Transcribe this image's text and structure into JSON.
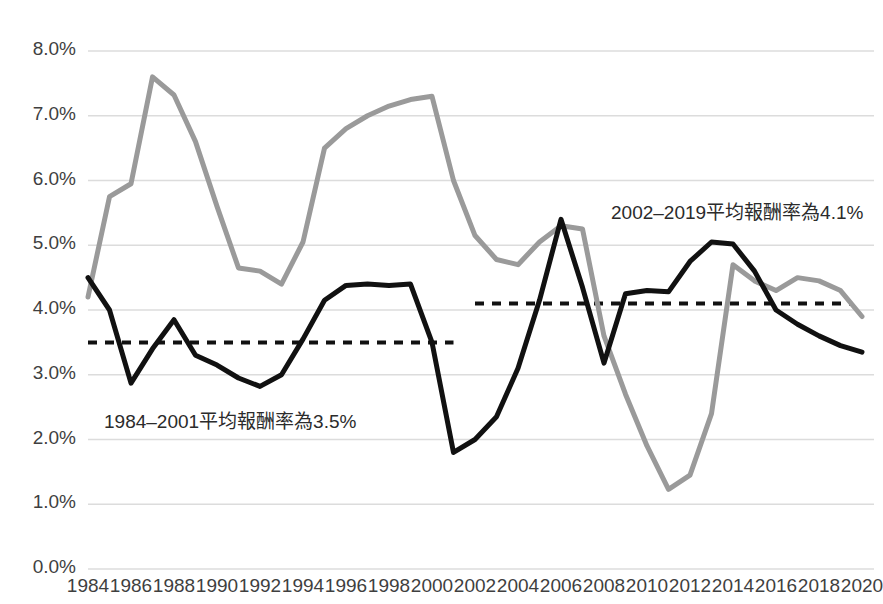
{
  "chart_data": {
    "type": "line",
    "title": "",
    "subtitle": "",
    "xlabel": "",
    "ylabel": "",
    "xlim": [
      1984,
      2020
    ],
    "ylim": [
      0.0,
      8.0
    ],
    "y_unit": "%",
    "grid": true,
    "legend_position": "none",
    "x": [
      1984,
      1985,
      1986,
      1987,
      1988,
      1989,
      1990,
      1991,
      1992,
      1993,
      1994,
      1995,
      1996,
      1997,
      1998,
      1999,
      2000,
      2001,
      2002,
      2003,
      2004,
      2005,
      2006,
      2007,
      2008,
      2009,
      2010,
      2011,
      2012,
      2013,
      2014,
      2015,
      2016,
      2017,
      2018,
      2019,
      2020
    ],
    "y_ticks": [
      "0.0%",
      "1.0%",
      "2.0%",
      "3.0%",
      "4.0%",
      "5.0%",
      "6.0%",
      "7.0%",
      "8.0%"
    ],
    "y_tick_values": [
      0.0,
      1.0,
      2.0,
      3.0,
      4.0,
      5.0,
      6.0,
      7.0,
      8.0
    ],
    "x_ticks": [
      "1984",
      "1986",
      "1988",
      "1990",
      "1992",
      "1994",
      "1996",
      "1998",
      "2000",
      "2002",
      "2004",
      "2006",
      "2008",
      "2010",
      "2012",
      "2014",
      "2016",
      "2018",
      "2020"
    ],
    "x_tick_values": [
      1984,
      1986,
      1988,
      1990,
      1992,
      1994,
      1996,
      1998,
      2000,
      2002,
      2004,
      2006,
      2008,
      2010,
      2012,
      2014,
      2016,
      2018,
      2020
    ],
    "series": [
      {
        "name": "black-series",
        "color": "#111111",
        "width": 5,
        "values": [
          4.5,
          4.0,
          2.87,
          3.4,
          3.85,
          3.3,
          3.15,
          2.95,
          2.82,
          3.0,
          3.55,
          4.15,
          4.38,
          4.4,
          4.38,
          4.4,
          3.5,
          1.8,
          2.0,
          2.35,
          3.1,
          4.15,
          5.4,
          4.35,
          3.18,
          4.25,
          4.3,
          4.28,
          4.75,
          5.05,
          5.02,
          4.6,
          4.0,
          3.78,
          3.6,
          3.45,
          3.35
        ]
      },
      {
        "name": "gray-series",
        "color": "#9a9a9a",
        "width": 5,
        "values": [
          4.2,
          5.75,
          5.95,
          7.6,
          7.32,
          6.6,
          5.6,
          4.65,
          4.6,
          4.4,
          5.05,
          6.5,
          6.8,
          7.0,
          7.15,
          7.25,
          7.3,
          6.0,
          5.15,
          4.78,
          4.7,
          5.05,
          5.3,
          5.25,
          3.6,
          2.7,
          1.9,
          1.23,
          1.45,
          2.4,
          4.7,
          4.45,
          4.3,
          4.5,
          4.45,
          4.3,
          3.9
        ]
      }
    ],
    "reference_lines": [
      {
        "name": "average-1984-2001",
        "value": 3.5,
        "x_start": 1984,
        "x_end": 2001,
        "style": "dashed",
        "color": "#111111"
      },
      {
        "name": "average-2002-2019",
        "value": 4.1,
        "x_start": 2002,
        "x_end": 2019.5,
        "style": "dashed",
        "color": "#111111"
      }
    ],
    "annotations": [
      {
        "name": "annotation-first-period",
        "text": "1984–2001平均報酬率為3.5%",
        "x_px": 104,
        "y_px": 406
      },
      {
        "name": "annotation-second-period",
        "text": "2002–2019平均報酬率為4.1%",
        "x_px": 611,
        "y_px": 197
      }
    ],
    "colors": {
      "grid": "#dcdcdc",
      "tick_text": "#3f3f3f",
      "annotation_text": "#2b2b2b",
      "background": "#ffffff"
    }
  }
}
